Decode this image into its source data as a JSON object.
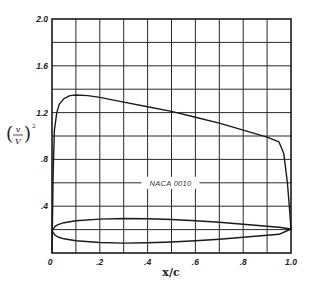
{
  "chart_data": {
    "type": "line",
    "title": "",
    "xlabel": "x/c",
    "ylabel": "(v/V)^2",
    "xlim": [
      0,
      1.0
    ],
    "ylim": [
      0,
      2.0
    ],
    "grid": true,
    "x_ticks": [
      0,
      0.2,
      0.4,
      0.6,
      0.8,
      1.0
    ],
    "x_tick_labels": [
      "0",
      ".2",
      ".4",
      ".6",
      ".8",
      "1.0"
    ],
    "y_ticks": [
      0.4,
      0.8,
      1.2,
      1.6,
      2.0
    ],
    "y_tick_labels": [
      ".4",
      ".8",
      "1.2",
      "1.6",
      "2.0"
    ],
    "annotations": [
      {
        "text": "NACA 0010",
        "x": 0.5,
        "y": 0.6
      }
    ],
    "series": [
      {
        "name": "velocity distribution (v/V)^2",
        "x": [
          0.0,
          0.005,
          0.01,
          0.02,
          0.03,
          0.05,
          0.075,
          0.1,
          0.15,
          0.2,
          0.3,
          0.4,
          0.5,
          0.6,
          0.7,
          0.8,
          0.9,
          0.95,
          0.97,
          0.985,
          0.995,
          1.0
        ],
        "y": [
          0.0,
          0.7,
          1.05,
          1.2,
          1.27,
          1.32,
          1.345,
          1.35,
          1.345,
          1.33,
          1.29,
          1.25,
          1.21,
          1.16,
          1.11,
          1.05,
          0.99,
          0.95,
          0.85,
          0.6,
          0.35,
          0.2
        ]
      },
      {
        "name": "airfoil upper surface (NACA 0010 profile)",
        "x": [
          0.0,
          0.0125,
          0.025,
          0.05,
          0.1,
          0.2,
          0.3,
          0.4,
          0.5,
          0.6,
          0.7,
          0.8,
          0.9,
          0.95,
          1.0
        ],
        "y": [
          0.19,
          0.228,
          0.243,
          0.259,
          0.275,
          0.29,
          0.295,
          0.293,
          0.286,
          0.275,
          0.262,
          0.246,
          0.229,
          0.22,
          0.205
        ]
      },
      {
        "name": "airfoil lower surface (NACA 0010 profile)",
        "x": [
          0.0,
          0.0125,
          0.025,
          0.05,
          0.1,
          0.2,
          0.3,
          0.4,
          0.5,
          0.6,
          0.7,
          0.8,
          0.9,
          0.95,
          1.0
        ],
        "y": [
          0.19,
          0.152,
          0.137,
          0.121,
          0.105,
          0.09,
          0.085,
          0.087,
          0.094,
          0.105,
          0.118,
          0.134,
          0.151,
          0.16,
          0.205
        ]
      }
    ]
  },
  "plot_box": {
    "left": 52,
    "top": 19,
    "width": 239,
    "height": 234
  },
  "colors": {
    "line": "#1a1a1a",
    "grid": "#2a2a2a",
    "background": "#ffffff"
  }
}
